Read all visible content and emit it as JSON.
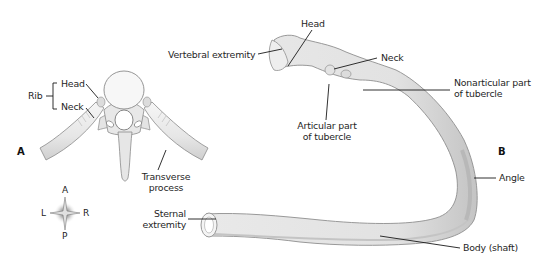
{
  "figure": {
    "panels": [
      {
        "id": "A",
        "label": "A",
        "view": "superior view of thoracic vertebra with articulating ribs"
      },
      {
        "id": "B",
        "label": "B",
        "view": "typical rib, posterior view"
      }
    ]
  },
  "panel_a": {
    "letter": "A",
    "rib_bracket_label": "Rib",
    "labels": {
      "head": "Head",
      "neck": "Neck",
      "transverse_process_line1": "Transverse",
      "transverse_process_line2": "process"
    }
  },
  "compass": {
    "top": "A",
    "bottom": "P",
    "left": "L",
    "right": "R"
  },
  "panel_b": {
    "letter": "B",
    "labels": {
      "vertebral_extremity": "Vertebral extremity",
      "head": "Head",
      "neck": "Neck",
      "nonarticular_line1": "Nonarticular part",
      "nonarticular_line2": "of tubercle",
      "articular_line1": "Articular part",
      "articular_line2": "of tubercle",
      "angle": "Angle",
      "sternal_line1": "Sternal",
      "sternal_line2": "extremity",
      "body": "Body (shaft)"
    }
  },
  "colors": {
    "bone_fill": "#ececec",
    "bone_shade": "#c9c9c9",
    "bone_outline": "#8a8a8a",
    "leader_line": "#1a1a1a",
    "text": "#1f1f1f"
  }
}
